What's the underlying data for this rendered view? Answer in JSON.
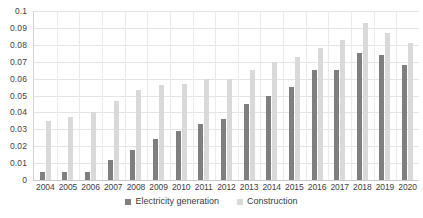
{
  "chart_data": {
    "type": "bar",
    "title": "",
    "subtitle": "",
    "xlabel": "",
    "ylabel": "",
    "ylim": [
      0,
      0.1
    ],
    "ytick_values": [
      0,
      0.01,
      0.02,
      0.03,
      0.04,
      0.05,
      0.06,
      0.07,
      0.08,
      0.09,
      0.1
    ],
    "ytick_labels": [
      "0",
      "0.01",
      "0.02",
      "0.03",
      "0.04",
      "0.05",
      "0.06",
      "0.07",
      "0.08",
      "0.09",
      "0.1"
    ],
    "grid": true,
    "legend_position": "bottom",
    "categories": [
      "2004",
      "2005",
      "2006",
      "2007",
      "2008",
      "2009",
      "2010",
      "2011",
      "2012",
      "2013",
      "2014",
      "2015",
      "2016",
      "2017",
      "2018",
      "2019",
      "2020"
    ],
    "series": [
      {
        "name": "Electricity generation",
        "color": "#7f7f7f",
        "values": [
          0.005,
          0.005,
          0.005,
          0.012,
          0.018,
          0.024,
          0.029,
          0.033,
          0.036,
          0.045,
          0.05,
          0.055,
          0.065,
          0.065,
          0.075,
          0.074,
          0.068
        ]
      },
      {
        "name": "Construction",
        "color": "#d9d9d9",
        "values": [
          0.035,
          0.037,
          0.04,
          0.047,
          0.053,
          0.056,
          0.057,
          0.06,
          0.06,
          0.065,
          0.07,
          0.073,
          0.078,
          0.083,
          0.093,
          0.087,
          0.081
        ]
      }
    ],
    "legend": [
      {
        "label": "Electricity generation",
        "color": "#7f7f7f",
        "swatch": "square-swatch"
      },
      {
        "label": "Construction",
        "color": "#d9d9d9",
        "swatch": "square-swatch"
      }
    ]
  }
}
